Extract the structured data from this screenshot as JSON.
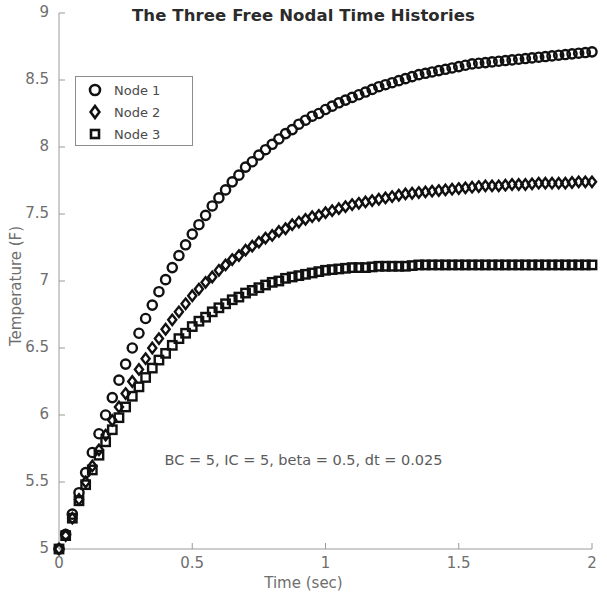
{
  "chart_data": {
    "type": "scatter",
    "title": "The Three Free Nodal Time Histories",
    "xlabel": "Time (sec)",
    "ylabel": "Temperature (F)",
    "xlim": [
      0,
      2
    ],
    "ylim": [
      5,
      9
    ],
    "xticks": [
      "0",
      "0.5",
      "1",
      "1.5",
      "2"
    ],
    "xtick_values": [
      0,
      0.5,
      1,
      1.5,
      2
    ],
    "yticks": [
      "5",
      "5.5",
      "6",
      "6.5",
      "7",
      "7.5",
      "8",
      "8.5",
      "9"
    ],
    "ytick_values": [
      5,
      5.5,
      6,
      6.5,
      7,
      7.5,
      8,
      8.5,
      9
    ],
    "grid": false,
    "legend_position": "upper left",
    "annotation": "BC = 5, IC = 5, beta = 0.5, dt = 0.025",
    "dt": 0.025,
    "series": [
      {
        "name": "Node 1",
        "marker": "circle",
        "color": "#111111",
        "initial_value": 5,
        "plateau": 8.71,
        "time_constant": 0.36,
        "x": [
          0,
          0.025,
          0.05,
          0.075,
          0.1,
          0.125,
          0.15,
          0.175,
          0.2,
          0.225,
          0.25,
          0.275,
          0.3,
          0.325,
          0.35,
          0.375,
          0.4,
          0.425,
          0.45,
          0.475,
          0.5,
          0.525,
          0.55,
          0.575,
          0.6,
          0.625,
          0.65,
          0.675,
          0.7,
          0.725,
          0.75,
          0.775,
          0.8,
          0.825,
          0.85,
          0.875,
          0.9,
          0.925,
          0.95,
          0.975,
          1.0,
          1.05,
          1.1,
          1.15,
          1.2,
          1.25,
          1.3,
          1.35,
          1.4,
          1.45,
          1.5,
          1.55,
          1.6,
          1.65,
          1.7,
          1.75,
          1.8,
          1.85,
          1.9,
          1.95,
          2.0
        ],
        "values": [
          5.0,
          5.11,
          5.26,
          5.42,
          5.57,
          5.72,
          5.86,
          6.0,
          6.13,
          6.26,
          6.38,
          6.5,
          6.61,
          6.72,
          6.82,
          6.92,
          7.01,
          7.1,
          7.19,
          7.27,
          7.35,
          7.42,
          7.49,
          7.56,
          7.62,
          7.68,
          7.74,
          7.79,
          7.85,
          7.89,
          7.94,
          7.98,
          8.02,
          8.06,
          8.1,
          8.13,
          8.17,
          8.2,
          8.23,
          8.25,
          8.28,
          8.33,
          8.37,
          8.41,
          8.45,
          8.48,
          8.51,
          8.54,
          8.56,
          8.58,
          8.6,
          8.62,
          8.63,
          8.64,
          8.65,
          8.66,
          8.67,
          8.68,
          8.69,
          8.7,
          8.71
        ]
      },
      {
        "name": "Node 2",
        "marker": "diamond",
        "color": "#111111",
        "initial_value": 5,
        "plateau": 7.74,
        "time_constant": 0.3,
        "x": [
          0,
          0.025,
          0.05,
          0.075,
          0.1,
          0.125,
          0.15,
          0.175,
          0.2,
          0.225,
          0.25,
          0.275,
          0.3,
          0.325,
          0.35,
          0.375,
          0.4,
          0.425,
          0.45,
          0.475,
          0.5,
          0.525,
          0.55,
          0.575,
          0.6,
          0.625,
          0.65,
          0.675,
          0.7,
          0.725,
          0.75,
          0.775,
          0.8,
          0.825,
          0.85,
          0.875,
          0.9,
          0.925,
          0.95,
          0.975,
          1.0,
          1.05,
          1.1,
          1.15,
          1.2,
          1.25,
          1.3,
          1.35,
          1.4,
          1.45,
          1.5,
          1.55,
          1.6,
          1.65,
          1.7,
          1.75,
          1.8,
          1.85,
          1.9,
          1.95,
          2.0
        ],
        "values": [
          5.0,
          5.1,
          5.23,
          5.37,
          5.5,
          5.62,
          5.74,
          5.85,
          5.96,
          6.06,
          6.16,
          6.25,
          6.34,
          6.42,
          6.5,
          6.57,
          6.64,
          6.71,
          6.77,
          6.83,
          6.89,
          6.94,
          6.99,
          7.03,
          7.08,
          7.12,
          7.16,
          7.19,
          7.23,
          7.26,
          7.29,
          7.32,
          7.34,
          7.37,
          7.39,
          7.42,
          7.44,
          7.46,
          7.48,
          7.49,
          7.51,
          7.54,
          7.57,
          7.59,
          7.61,
          7.63,
          7.65,
          7.66,
          7.67,
          7.68,
          7.69,
          7.7,
          7.71,
          7.71,
          7.72,
          7.72,
          7.73,
          7.73,
          7.73,
          7.74,
          7.74
        ]
      },
      {
        "name": "Node 3",
        "marker": "square",
        "color": "#111111",
        "initial_value": 5,
        "plateau": 7.12,
        "time_constant": 0.27,
        "x": [
          0,
          0.025,
          0.05,
          0.075,
          0.1,
          0.125,
          0.15,
          0.175,
          0.2,
          0.225,
          0.25,
          0.275,
          0.3,
          0.325,
          0.35,
          0.375,
          0.4,
          0.425,
          0.45,
          0.475,
          0.5,
          0.525,
          0.55,
          0.575,
          0.6,
          0.625,
          0.65,
          0.675,
          0.7,
          0.725,
          0.75,
          0.775,
          0.8,
          0.825,
          0.85,
          0.875,
          0.9,
          0.925,
          0.95,
          0.975,
          1.0,
          1.05,
          1.1,
          1.15,
          1.2,
          1.25,
          1.3,
          1.35,
          1.4,
          1.45,
          1.5,
          1.55,
          1.6,
          1.65,
          1.7,
          1.75,
          1.8,
          1.85,
          1.9,
          1.95,
          2.0
        ],
        "values": [
          5.0,
          5.1,
          5.23,
          5.36,
          5.48,
          5.59,
          5.7,
          5.8,
          5.89,
          5.98,
          6.06,
          6.14,
          6.21,
          6.28,
          6.35,
          6.41,
          6.46,
          6.52,
          6.57,
          6.61,
          6.66,
          6.7,
          6.73,
          6.77,
          6.8,
          6.83,
          6.86,
          6.88,
          6.91,
          6.93,
          6.95,
          6.97,
          6.99,
          7.0,
          7.02,
          7.03,
          7.04,
          7.05,
          7.06,
          7.07,
          7.08,
          7.09,
          7.1,
          7.1,
          7.11,
          7.11,
          7.11,
          7.12,
          7.12,
          7.12,
          7.12,
          7.12,
          7.12,
          7.12,
          7.12,
          7.12,
          7.12,
          7.12,
          7.12,
          7.12,
          7.12
        ]
      }
    ]
  },
  "legend": {
    "items": [
      {
        "label": "Node 1",
        "marker": "circle-marker"
      },
      {
        "label": "Node 2",
        "marker": "diamond-marker"
      },
      {
        "label": "Node 3",
        "marker": "square-marker"
      }
    ]
  },
  "axes": {
    "title": "The Three Free Nodal Time Histories",
    "xlabel": "Time (sec)",
    "ylabel": "Temperature (F)",
    "annotation": "BC = 5, IC = 5, beta = 0.5, dt = 0.025",
    "xtick_labels": [
      "0",
      "0.5",
      "1",
      "1.5",
      "2"
    ],
    "ytick_labels": [
      "5",
      "5.5",
      "6",
      "6.5",
      "7",
      "7.5",
      "8",
      "8.5",
      "9"
    ]
  },
  "colors": {
    "series": "#111111",
    "axis": "#9a9a9a",
    "tick_text": "#6e6e6e",
    "title_text": "#2b2b2b",
    "background": "#ffffff"
  }
}
